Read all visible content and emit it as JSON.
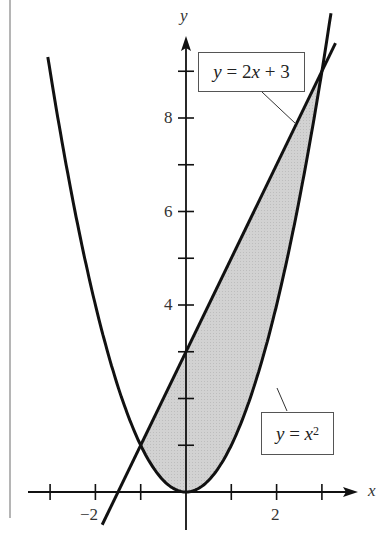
{
  "chart_data": {
    "type": "area",
    "title": "",
    "xlabel": "x",
    "ylabel": "y",
    "xlim": [
      -3.5,
      4
    ],
    "ylim": [
      -0.6,
      10
    ],
    "x_ticks": [
      -3,
      -2,
      -1,
      1,
      2,
      3
    ],
    "x_tick_labels": [
      {
        "value": -2,
        "label": "−2"
      },
      {
        "value": 2,
        "label": "2"
      }
    ],
    "y_ticks": [
      1,
      2,
      3,
      4,
      5,
      6,
      7,
      8,
      9
    ],
    "y_tick_labels": [
      {
        "value": 4,
        "label": "4"
      },
      {
        "value": 6,
        "label": "6"
      },
      {
        "value": 8,
        "label": "8"
      }
    ],
    "grid": false,
    "series": [
      {
        "name": "y = 2x + 3",
        "type": "line",
        "equation": "2x+3",
        "x_range": [
          -1.85,
          3.3
        ]
      },
      {
        "name": "y = x^2",
        "type": "curve",
        "equation": "x^2",
        "x_range": [
          -3.05,
          3.2
        ]
      }
    ],
    "shaded_region": {
      "between": [
        "y = x^2",
        "y = 2x + 3"
      ],
      "x_range": [
        -1,
        3
      ],
      "fill": "#cfcfcf"
    },
    "intersections": [
      [
        -1,
        1
      ],
      [
        3,
        9
      ]
    ],
    "annotations": [
      {
        "text": "y = 2x + 3",
        "points_to": "line"
      },
      {
        "text": "y = x²",
        "points_to": "parabola"
      }
    ]
  },
  "labels": {
    "x_axis": "x",
    "y_axis": "y",
    "tick_neg2": "−2",
    "tick_2": "2",
    "tick_4": "4",
    "tick_6": "6",
    "tick_8": "8",
    "line_label_y": "y",
    "line_label_rest": " = 2",
    "line_label_x": "x",
    "line_label_tail": " + 3",
    "parab_label_y": "y",
    "parab_label_eq": " = ",
    "parab_label_x": "x",
    "parab_label_exp": "2"
  }
}
